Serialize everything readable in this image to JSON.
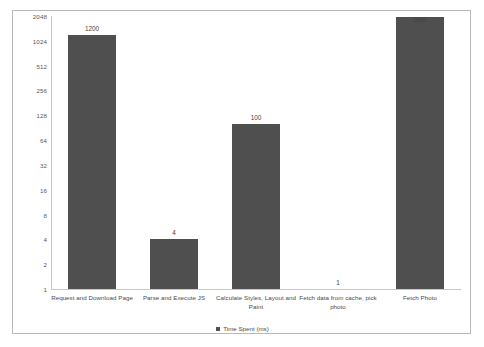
{
  "chart_data": {
    "type": "bar",
    "title": "",
    "subtitle": "",
    "xlabel": "",
    "ylabel": "",
    "categories": [
      "Request and Download Page",
      "Parse and Execute JS",
      "Calculate Styles, Layout and Paint",
      "Fetch data from cache, pick photo",
      "Fetch Photo"
    ],
    "values": [
      1200,
      4,
      100,
      1,
      2000
    ],
    "value_labels": [
      "1200",
      "4",
      "100",
      "1",
      "2000"
    ],
    "series": [
      {
        "name": "Time Spent (ms)",
        "values": [
          1200,
          4,
          100,
          1,
          2000
        ],
        "color": "#4f4f4f"
      }
    ],
    "y_scale": "log2",
    "ylim": [
      1,
      2048
    ],
    "y_ticks": [
      1,
      2,
      4,
      8,
      16,
      32,
      64,
      128,
      256,
      512,
      1024,
      2048
    ],
    "y_tick_labels": [
      "1",
      "2",
      "4",
      "8",
      "16",
      "32",
      "64",
      "128",
      "256",
      "512",
      "1024",
      "2048"
    ],
    "grid": false,
    "legend": {
      "position": "bottom",
      "entries": [
        "Time Spent (ms)"
      ]
    }
  },
  "legend": {
    "label": "Time Spent (ms)",
    "marker_color": "#4f4f4f"
  },
  "colors": {
    "bar": "#4f4f4f",
    "axis": "#c9c9c9",
    "frame": "#b8b8b8",
    "text": "#4a4a4a",
    "background": "#ffffff"
  }
}
